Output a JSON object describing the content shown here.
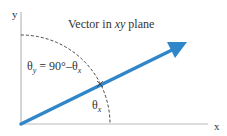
{
  "diagram": {
    "title_prefix": "Vector in ",
    "title_italic": "xy",
    "title_suffix": " plane",
    "axes": {
      "x_label": "x",
      "y_label": "y"
    },
    "angle_labels": {
      "theta_y": {
        "symbol": "θ",
        "sub": "y",
        "rest": " = 90°–θ",
        "rest_sub": "x"
      },
      "theta_x": {
        "symbol": "θ",
        "sub": "x"
      }
    },
    "colors": {
      "vector": "#2f86c8",
      "axis": "#bbbbbb",
      "dashed_arc": "#333333",
      "text": "#333333"
    }
  }
}
